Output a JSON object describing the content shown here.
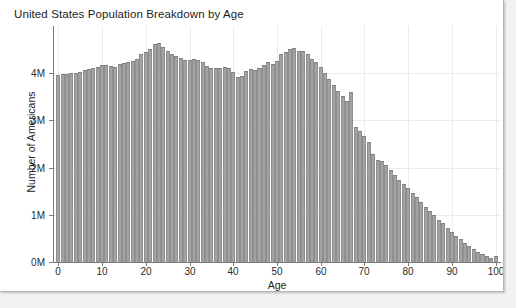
{
  "chart_data": {
    "type": "bar",
    "title": "United States Population Breakdown by Age",
    "xlabel": "Age",
    "ylabel": "Number of Americans",
    "xlim": [
      -1,
      101
    ],
    "ylim": [
      0,
      5000000
    ],
    "grid": true,
    "legend": null,
    "bar_color": "#a3a3a3",
    "bar_edge_color": "#7d7d7d",
    "background_color": "#ffffff",
    "x_tick_labels": [
      "0",
      "10",
      "20",
      "30",
      "40",
      "50",
      "60",
      "70",
      "80",
      "90",
      "100"
    ],
    "x_tick_values": [
      0,
      10,
      20,
      30,
      40,
      50,
      60,
      70,
      80,
      90,
      100
    ],
    "y_tick_labels": [
      "0M",
      "1M",
      "2M",
      "3M",
      "4M"
    ],
    "y_tick_values": [
      0,
      1000000,
      2000000,
      3000000,
      4000000
    ],
    "categories": [
      0,
      1,
      2,
      3,
      4,
      5,
      6,
      7,
      8,
      9,
      10,
      11,
      12,
      13,
      14,
      15,
      16,
      17,
      18,
      19,
      20,
      21,
      22,
      23,
      24,
      25,
      26,
      27,
      28,
      29,
      30,
      31,
      32,
      33,
      34,
      35,
      36,
      37,
      38,
      39,
      40,
      41,
      42,
      43,
      44,
      45,
      46,
      47,
      48,
      49,
      50,
      51,
      52,
      53,
      54,
      55,
      56,
      57,
      58,
      59,
      60,
      61,
      62,
      63,
      64,
      65,
      66,
      67,
      68,
      69,
      70,
      71,
      72,
      73,
      74,
      75,
      76,
      77,
      78,
      79,
      80,
      81,
      82,
      83,
      84,
      85,
      86,
      87,
      88,
      89,
      90,
      91,
      92,
      93,
      94,
      95,
      96,
      97,
      98,
      99,
      100
    ],
    "values": [
      3970000,
      3980000,
      3980000,
      4000000,
      4010000,
      4030000,
      4060000,
      4080000,
      4100000,
      4130000,
      4170000,
      4170000,
      4160000,
      4140000,
      4190000,
      4210000,
      4230000,
      4260000,
      4300000,
      4400000,
      4450000,
      4520000,
      4620000,
      4640000,
      4560000,
      4480000,
      4410000,
      4360000,
      4330000,
      4290000,
      4290000,
      4310000,
      4280000,
      4230000,
      4150000,
      4120000,
      4100000,
      4120000,
      4130000,
      4110000,
      4030000,
      3930000,
      3950000,
      4050000,
      4090000,
      4070000,
      4100000,
      4180000,
      4230000,
      4200000,
      4250000,
      4410000,
      4460000,
      4510000,
      4530000,
      4480000,
      4470000,
      4400000,
      4310000,
      4240000,
      4130000,
      4010000,
      3880000,
      3740000,
      3620000,
      3510000,
      3420000,
      3610000,
      2870000,
      2770000,
      2660000,
      2550000,
      2280000,
      2170000,
      2130000,
      2050000,
      1940000,
      1840000,
      1740000,
      1660000,
      1570000,
      1470000,
      1370000,
      1270000,
      1170000,
      1080000,
      990000,
      900000,
      820000,
      730000,
      640000,
      560000,
      480000,
      410000,
      340000,
      280000,
      220000,
      170000,
      130000,
      95000,
      130000
    ]
  },
  "panel": {
    "border_color": "#b6b6b6",
    "page_background": "#f2f2f2"
  }
}
